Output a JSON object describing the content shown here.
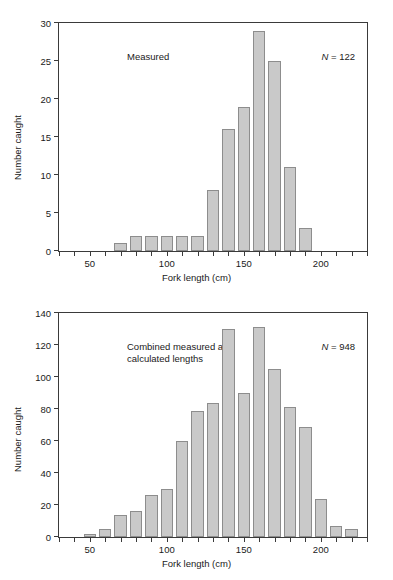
{
  "figure": {
    "background": "#ffffff",
    "bar_fill": "#c9c9c9",
    "bar_stroke": "#8d8d8d",
    "axis_color": "#3a3a3a"
  },
  "panels": [
    {
      "id": "top",
      "note": "Measured",
      "n_prefix": "N",
      "n_equals": " = ",
      "n_value": "122",
      "xlabel": "Fork length (cm)",
      "ylabel": "Number caught",
      "yticks": [
        "0",
        "5",
        "10",
        "15",
        "20",
        "25",
        "30"
      ],
      "xticks": [
        "50",
        "100",
        "150",
        "200"
      ]
    },
    {
      "id": "bottom",
      "note": "Combined measured and\ncalculated lengths",
      "n_prefix": "N",
      "n_equals": " = ",
      "n_value": "948",
      "xlabel": "Fork length (cm)",
      "ylabel": "Number caught",
      "yticks": [
        "0",
        "20",
        "40",
        "60",
        "80",
        "100",
        "120",
        "140"
      ],
      "xticks": [
        "50",
        "100",
        "150",
        "200"
      ]
    }
  ],
  "chart_data": [
    {
      "type": "bar",
      "title": "Measured",
      "xlabel": "Fork length (cm)",
      "ylabel": "Number caught",
      "xlim": [
        30,
        230
      ],
      "ylim": [
        0,
        30
      ],
      "ytick_values": [
        0,
        5,
        10,
        15,
        20,
        25,
        30
      ],
      "xtick_values": [
        50,
        100,
        150,
        200
      ],
      "xtick_minor_step": 10,
      "bin_width": 10,
      "grid": false,
      "legend": null,
      "annotations": [
        "N = 122"
      ],
      "categories": [
        70,
        80,
        90,
        100,
        110,
        120,
        130,
        140,
        150,
        160,
        170,
        180,
        190
      ],
      "values": [
        1,
        2,
        2,
        2,
        2,
        2,
        8,
        16,
        19,
        29,
        25,
        11,
        3
      ]
    },
    {
      "type": "bar",
      "title": "Combined measured and calculated lengths",
      "xlabel": "Fork length (cm)",
      "ylabel": "Number caught",
      "xlim": [
        30,
        230
      ],
      "ylim": [
        0,
        140
      ],
      "ytick_values": [
        0,
        20,
        40,
        60,
        80,
        100,
        120,
        140
      ],
      "xtick_values": [
        50,
        100,
        150,
        200
      ],
      "xtick_minor_step": 10,
      "bin_width": 10,
      "grid": false,
      "legend": null,
      "annotations": [
        "N = 948"
      ],
      "categories": [
        50,
        60,
        70,
        80,
        90,
        100,
        110,
        120,
        130,
        140,
        150,
        160,
        170,
        180,
        190,
        200,
        210,
        220
      ],
      "values": [
        2,
        5,
        14,
        16,
        26,
        30,
        60,
        79,
        84,
        130,
        90,
        131,
        105,
        81,
        69,
        24,
        7,
        5
      ]
    }
  ]
}
